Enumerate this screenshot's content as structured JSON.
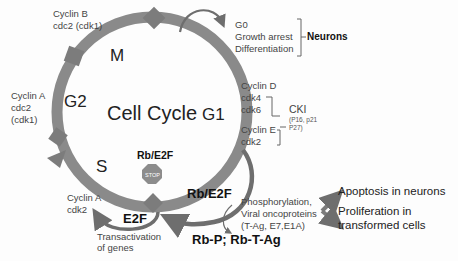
{
  "diagram": {
    "title": "Cell Cycle",
    "phases": {
      "m": "M",
      "g1": "G1",
      "g2": "G2",
      "s": "S"
    },
    "checkpoints": {
      "cyclin_b": {
        "line1": "Cyclin B",
        "line2": "cdc2 (cdk1)"
      },
      "cyclin_a_g2": {
        "line1": "Cyclin A",
        "line2": "cdc2",
        "line3": "(cdk1)"
      },
      "cyclin_a_s": {
        "line1": "Cyclin A",
        "line2": "cdk2"
      },
      "cyclin_d": {
        "line1": "Cyclin D",
        "line2": "cdk4",
        "line3": "cdk6"
      },
      "cyclin_e": {
        "line1": "Cyclin E",
        "line2": "cdk2"
      }
    },
    "cki": {
      "label": "CKI",
      "line1": "(P16, p21",
      "line2": "P27)"
    },
    "g0": {
      "line1": "G0",
      "line2": "Growth arrest",
      "line3": "Differentiation",
      "target": "Neurons"
    },
    "stop": {
      "label": "Rb/E2F",
      "sign": "STOP"
    },
    "rb_e2f": "Rb/E2F",
    "e2f": {
      "label": "E2F",
      "line1": "Transactivation",
      "line2": "of genes"
    },
    "phosphorylation": {
      "line1": "Phosphorylation,",
      "line2": "Viral oncoproteins",
      "line3": "(T-Ag, E7,E1A)"
    },
    "rb_products": "Rb-P; Rb-T-Ag",
    "outcomes": {
      "apoptosis": "Apoptosis in neurons",
      "proliferation_line1": "Proliferation in",
      "proliferation_line2": "transformed cells"
    },
    "colors": {
      "ring": "#8a8a8a",
      "arrow_dark": "#6e6e6e",
      "stop": "#8c8c8c",
      "text": "#222222"
    }
  }
}
